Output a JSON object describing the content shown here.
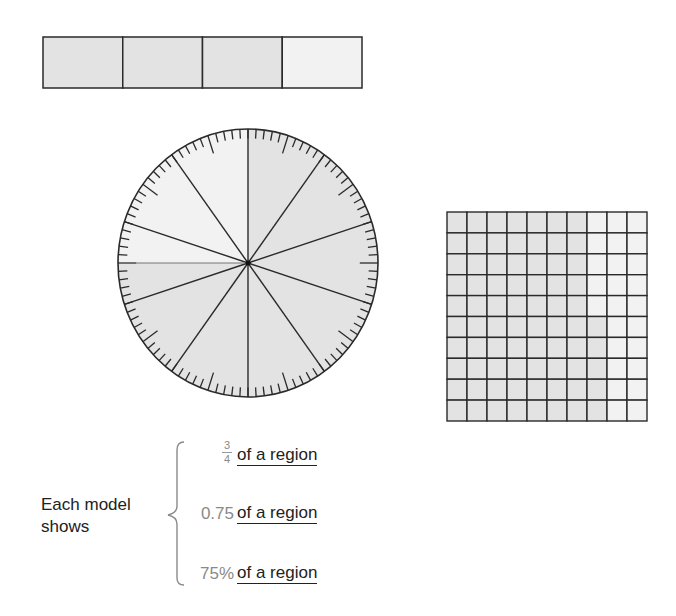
{
  "colors": {
    "shaded": "#e3e3e3",
    "unshaded": "#f2f2f2",
    "line": "#2a2a2a",
    "value_text": "#8a8a8a",
    "label_text": "#222222"
  },
  "bar_model": {
    "parts": 4,
    "shaded_parts": 3,
    "x": 43,
    "y": 37,
    "width": 319,
    "height": 51
  },
  "circle_model": {
    "cx": 248,
    "cy": 263,
    "rx": 130,
    "ry": 134,
    "spokes": 10,
    "extra_divider_angle_deg": 270,
    "unshaded_quarter": "upper-left",
    "tick_count": 100,
    "long_tick_offset_deg": 18,
    "long_tick_every_deg": 36
  },
  "grid_model": {
    "x": 447,
    "y": 212,
    "width": 200,
    "height": 209,
    "rows": 10,
    "cols": 10,
    "shaded_full_columns": 7,
    "partial_column_shaded_bottom_cells": 5,
    "shaded_total": 75
  },
  "summary": {
    "caption_line1": "Each model",
    "caption_line2": "shows",
    "rows": [
      {
        "value_type": "fraction",
        "numerator": "3",
        "denominator": "4",
        "label": "of a region"
      },
      {
        "value_type": "decimal",
        "value": "0.75",
        "label": "of a region"
      },
      {
        "value_type": "percent",
        "value": "75%",
        "label": "of a region"
      }
    ]
  }
}
